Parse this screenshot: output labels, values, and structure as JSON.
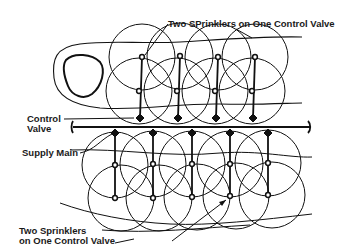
{
  "diagram": {
    "type": "sprinkler-layout",
    "labels": {
      "top_callout": "Two SPrinklers on One Control Valve",
      "control_valve_line1": "Control",
      "control_valve_line2": "Valve",
      "supply_main": "Supply Main",
      "bottom_callout_line1": "Two Sprinklers",
      "bottom_callout_line2": "on One Control Valve"
    },
    "colors": {
      "ink": "#111111",
      "background": "#ffffff"
    },
    "top_zone": {
      "laterals": [
        {
          "valve": [
            140,
            118
          ],
          "sprinklers": [
            [
              142,
              57
            ],
            [
              139,
              91
            ]
          ]
        },
        {
          "valve": [
            178,
            118
          ],
          "sprinklers": [
            [
              180,
              56
            ],
            [
              177,
              91
            ]
          ]
        },
        {
          "valve": [
            216,
            118
          ],
          "sprinklers": [
            [
              218,
              57
            ],
            [
              215,
              91
            ]
          ]
        },
        {
          "valve": [
            253,
            118
          ],
          "sprinklers": [
            [
              255,
              57
            ],
            [
              252,
              91
            ]
          ]
        }
      ]
    },
    "bottom_zone": {
      "laterals": [
        {
          "valve": [
            115,
            133
          ],
          "sprinklers": [
            [
              115,
              165
            ],
            [
              115,
              198
            ]
          ]
        },
        {
          "valve": [
            153,
            133
          ],
          "sprinklers": [
            [
              153,
              164
            ],
            [
              153,
              198
            ]
          ]
        },
        {
          "valve": [
            192,
            133
          ],
          "sprinklers": [
            [
              192,
              164
            ],
            [
              192,
              197
            ]
          ]
        },
        {
          "valve": [
            230,
            133
          ],
          "sprinklers": [
            [
              230,
              164
            ],
            [
              230,
              196
            ]
          ]
        },
        {
          "valve": [
            268,
            133
          ],
          "sprinklers": [
            [
              268,
              163
            ],
            [
              268,
              195
            ]
          ]
        }
      ]
    },
    "supply_main": {
      "x1": 73,
      "x2": 310,
      "y": 127
    }
  }
}
